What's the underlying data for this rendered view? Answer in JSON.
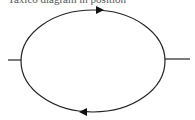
{
  "caption": "Taxico diagram in position",
  "diagram": {
    "shape": "ellipse",
    "stroke_color": "#222222",
    "arrows": [
      {
        "position": "top",
        "direction": "right"
      },
      {
        "position": "bottom",
        "direction": "left"
      }
    ],
    "leads": [
      "left",
      "right"
    ]
  }
}
